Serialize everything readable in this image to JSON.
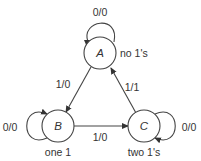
{
  "diagram": {
    "type": "state-machine",
    "states": [
      {
        "id": "A",
        "label": "A",
        "annotation": "no 1's"
      },
      {
        "id": "B",
        "label": "B",
        "annotation": "one 1"
      },
      {
        "id": "C",
        "label": "C",
        "annotation": "two 1's"
      }
    ],
    "transitions": [
      {
        "from": "A",
        "to": "A",
        "label": "0/0"
      },
      {
        "from": "A",
        "to": "B",
        "label": "1/0"
      },
      {
        "from": "B",
        "to": "B",
        "label": "0/0"
      },
      {
        "from": "B",
        "to": "C",
        "label": "1/0"
      },
      {
        "from": "C",
        "to": "C",
        "label": "0/0"
      },
      {
        "from": "C",
        "to": "A",
        "label": "1/1"
      }
    ],
    "colors": {
      "stroke": "#444444",
      "text": "#333333",
      "background": "#ffffff"
    }
  }
}
